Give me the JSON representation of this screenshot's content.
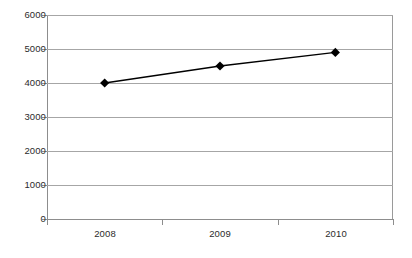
{
  "chart_data": {
    "type": "line",
    "title": "",
    "subtitle": "",
    "xlabel": "",
    "ylabel": "",
    "categories": [
      "2008",
      "2009",
      "2010"
    ],
    "series": [
      {
        "name": "Series 1",
        "values": [
          4000,
          4500,
          4900
        ],
        "color": "#000000",
        "marker": "diamond"
      }
    ],
    "ylim": [
      0,
      6000
    ],
    "ytick_values": [
      0,
      1000,
      2000,
      3000,
      4000,
      5000,
      6000
    ],
    "ytick_labels": [
      "0",
      "1000",
      "2000",
      "3000",
      "4000",
      "5000",
      "6000"
    ],
    "grid": {
      "horizontal": true,
      "vertical": false,
      "color": "#a6a6a6"
    },
    "legend": {
      "visible": false,
      "position": "none",
      "entries": []
    },
    "axis": {
      "line_color": "#8d8d8d",
      "frame": true,
      "tick_color": "#8d8d8d",
      "label_color": "#2b2b2b"
    },
    "plot_background": "#ffffff"
  }
}
